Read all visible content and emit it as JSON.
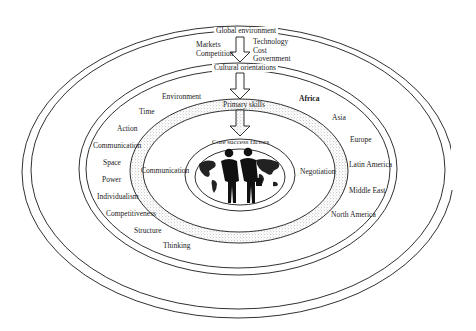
{
  "diagram": {
    "layers": {
      "global_environment": {
        "title": "Global environment",
        "factors_left": [
          "Markets",
          "Competition"
        ],
        "factors_right": [
          "Technology",
          "Cost",
          "Government"
        ]
      },
      "cultural_orientations": {
        "title": "Cultural orientations",
        "left_items": [
          "Environment",
          "Time",
          "Action",
          "Communication",
          "Space",
          "Power",
          "Individualism",
          "Competitiveness",
          "Structure",
          "Thinking"
        ],
        "right_items": [
          "Africa",
          "Asia",
          "Europe",
          "Latin America",
          "Middle East",
          "North America"
        ]
      },
      "primary_skills": {
        "title": "Primary skills",
        "left_item": "Communication",
        "right_item": "Negotiation"
      },
      "core_success_factors": {
        "title": "Core success factors"
      }
    },
    "icons": {
      "center": "business-people-world-map-icon",
      "arrows": "down-arrow-icon"
    },
    "colors": {
      "line": "#1a1a1a",
      "background": "#ffffff",
      "stipple": "#9a9a9a"
    }
  }
}
